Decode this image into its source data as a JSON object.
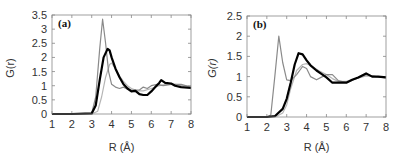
{
  "chart_data": [
    {
      "type": "line",
      "panel_label": "(a)",
      "xlabel": "R (Å)",
      "ylabel": "G(r)",
      "xlim": [
        1,
        8
      ],
      "ylim": [
        0,
        3.5
      ],
      "xticks": [
        "1",
        "2",
        "3",
        "4",
        "5",
        "6",
        "7",
        "8"
      ],
      "yticks": [
        "0",
        "0.5",
        "1",
        "1.5",
        "2",
        "2.5",
        "3",
        "3.5"
      ],
      "grid": false,
      "legend": null,
      "series": [
        {
          "name": "black-thick",
          "color": "#000000",
          "width": 2.2,
          "x": [
            1,
            2,
            3,
            3.2,
            3.4,
            3.6,
            3.8,
            3.9,
            4.0,
            4.2,
            4.4,
            4.6,
            4.8,
            5.0,
            5.2,
            5.4,
            5.6,
            5.8,
            6.0,
            6.2,
            6.4,
            6.5,
            6.7,
            7.0,
            7.2,
            7.5,
            8.0
          ],
          "y": [
            0,
            0,
            0.02,
            0.3,
            1.2,
            2.0,
            2.3,
            2.25,
            2.0,
            1.6,
            1.3,
            1.05,
            0.9,
            0.8,
            0.82,
            0.7,
            0.67,
            0.67,
            0.8,
            0.95,
            1.1,
            1.2,
            1.1,
            1.08,
            1.0,
            0.95,
            0.92
          ]
        },
        {
          "name": "gray-sharp",
          "color": "#8a8a8a",
          "width": 1.2,
          "x": [
            1,
            2,
            3,
            3.2,
            3.4,
            3.55,
            3.7,
            3.85,
            4.0,
            4.2,
            4.4,
            4.6,
            4.8,
            5.0,
            5.2,
            5.4,
            5.6,
            5.8,
            6.0,
            6.3,
            6.6,
            7.0,
            7.5,
            8.0
          ],
          "y": [
            0,
            0,
            0.02,
            0.6,
            2.3,
            3.35,
            2.5,
            1.5,
            1.05,
            0.95,
            0.9,
            0.95,
            0.88,
            0.85,
            0.85,
            0.85,
            0.95,
            0.9,
            1.0,
            1.05,
            1.0,
            1.05,
            1.05,
            0.95
          ]
        },
        {
          "name": "gray-light",
          "color": "#b5b5b5",
          "width": 1.2,
          "x": [
            1,
            2,
            3,
            3.3,
            3.5,
            3.7,
            3.9,
            4.0,
            4.2,
            4.4,
            4.6,
            4.8,
            5.0,
            5.3,
            5.6,
            6.0,
            6.4,
            6.8,
            7.2,
            7.6,
            8.0
          ],
          "y": [
            0,
            0,
            0,
            0.1,
            0.6,
            1.3,
            1.75,
            1.8,
            1.6,
            1.35,
            1.15,
            1.0,
            0.9,
            0.82,
            0.82,
            0.9,
            1.0,
            1.05,
            1.05,
            1.0,
            0.97
          ]
        }
      ]
    },
    {
      "type": "line",
      "panel_label": "(b)",
      "xlabel": "R (Å)",
      "ylabel": "G(r)",
      "xlim": [
        1,
        8
      ],
      "ylim": [
        0,
        2.5
      ],
      "xticks": [
        "1",
        "2",
        "3",
        "4",
        "5",
        "6",
        "7",
        "8"
      ],
      "yticks": [
        "0",
        "0.5",
        "1",
        "1.5",
        "2",
        "2.5"
      ],
      "grid": false,
      "legend": null,
      "series": [
        {
          "name": "black-thick",
          "color": "#000000",
          "width": 2.2,
          "x": [
            1,
            2,
            2.4,
            2.8,
            3.0,
            3.2,
            3.4,
            3.6,
            3.8,
            4.0,
            4.2,
            4.5,
            4.8,
            5.0,
            5.3,
            5.6,
            6.0,
            6.3,
            6.6,
            7.0,
            7.3,
            7.6,
            8.0
          ],
          "y": [
            0,
            0,
            0.02,
            0.2,
            0.45,
            0.85,
            1.3,
            1.58,
            1.55,
            1.4,
            1.28,
            1.15,
            1.05,
            0.98,
            0.85,
            0.85,
            0.85,
            0.92,
            0.98,
            1.08,
            1.0,
            1.0,
            0.98
          ]
        },
        {
          "name": "gray-sharp",
          "color": "#8a8a8a",
          "width": 1.2,
          "x": [
            1,
            2,
            2.2,
            2.4,
            2.6,
            2.8,
            3.0,
            3.2,
            3.5,
            3.8,
            4.0,
            4.2,
            4.5,
            4.8,
            5.0,
            5.3,
            5.6,
            6.0,
            6.5,
            7.0,
            7.5,
            8.0
          ],
          "y": [
            0,
            0,
            0.05,
            1.0,
            2.0,
            1.35,
            0.92,
            0.9,
            1.05,
            1.25,
            1.2,
            1.0,
            0.92,
            1.0,
            1.05,
            1.05,
            0.9,
            0.85,
            0.95,
            1.05,
            1.0,
            0.97
          ]
        },
        {
          "name": "gray-light",
          "color": "#b5b5b5",
          "width": 1.2,
          "x": [
            1,
            2,
            2.5,
            2.8,
            3.0,
            3.2,
            3.5,
            3.8,
            4.0,
            4.3,
            4.6,
            5.0,
            5.3,
            5.6,
            6.0,
            6.5,
            7.0,
            7.5,
            8.0
          ],
          "y": [
            0,
            0,
            0.02,
            0.1,
            0.3,
            0.7,
            1.15,
            1.3,
            1.32,
            1.25,
            1.15,
            1.05,
            0.95,
            0.88,
            0.88,
            0.95,
            1.02,
            1.0,
            0.98
          ]
        }
      ]
    }
  ]
}
